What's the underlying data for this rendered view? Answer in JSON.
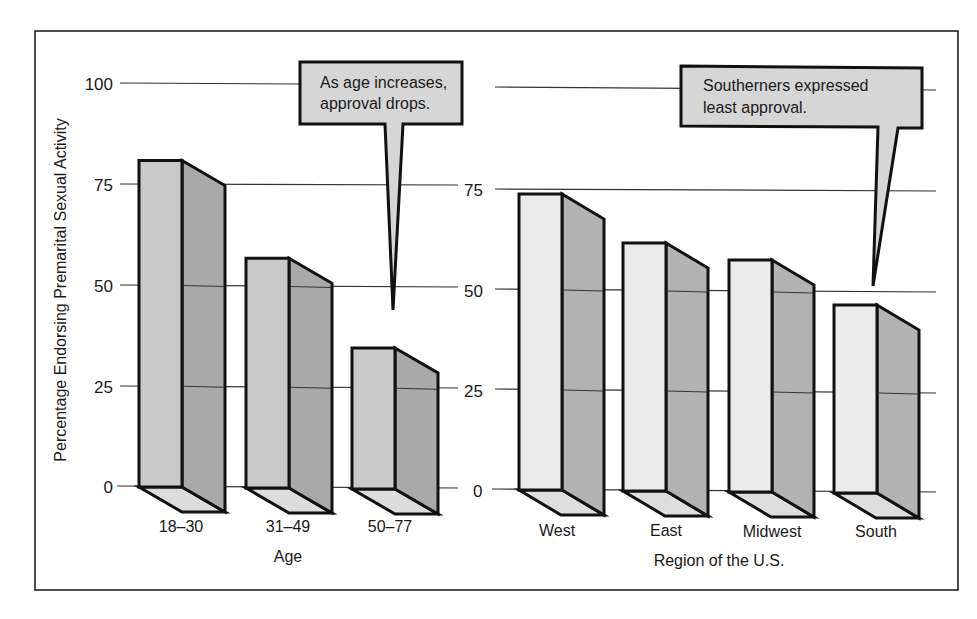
{
  "chart_data": [
    {
      "type": "bar",
      "style": "3d-column",
      "title": "",
      "xlabel": "Age",
      "ylabel": "Percentage Endorsing Premarital Sexual Activity",
      "categories": [
        "18–30",
        "31–49",
        "50–77"
      ],
      "values": [
        81,
        57,
        35
      ],
      "ylim": [
        0,
        100
      ],
      "yticks": [
        0,
        25,
        50,
        75,
        100
      ],
      "grid": true,
      "annotation": "As age increases, approval drops."
    },
    {
      "type": "bar",
      "style": "3d-column",
      "title": "",
      "xlabel": "Region of the U.S.",
      "ylabel": "",
      "categories": [
        "West",
        "East",
        "Midwest",
        "South"
      ],
      "values": [
        74,
        62,
        58,
        47
      ],
      "ylim": [
        0,
        100
      ],
      "yticks": [
        0,
        25,
        50,
        75
      ],
      "grid": true,
      "annotation": "Southerners expressed least approval."
    }
  ],
  "labels": {
    "ylabel": "Percentage Endorsing Premarital Sexual Activity",
    "age_xlabel": "Age",
    "region_xlabel": "Region of the U.S.",
    "age_ticks": [
      "100",
      "75",
      "50",
      "25",
      "0"
    ],
    "region_ticks": [
      "75",
      "50",
      "25",
      "0"
    ],
    "age_categories": [
      "18–30",
      "31–49",
      "50–77"
    ],
    "region_categories": [
      "West",
      "East",
      "Midwest",
      "South"
    ],
    "note_age_line1": "As age increases,",
    "note_age_line2": "approval drops.",
    "note_region_line1": "Southerners expressed",
    "note_region_line2": "least approval."
  },
  "colors": {
    "frame": "#222222",
    "grid": "#333333",
    "age_front": "#c9c9c9",
    "age_side": "#a9a9a9",
    "age_base": "#dcdcdc",
    "region_front": "#ebebeb",
    "region_side": "#b3b3b3",
    "region_base": "#dedede",
    "bubble": "#d6d6d6"
  }
}
